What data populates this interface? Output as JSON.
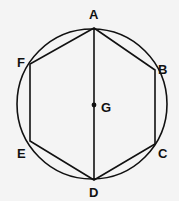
{
  "diagram": {
    "type": "geometry",
    "colors": {
      "stroke": "#111111",
      "background": "#f4f4f4"
    },
    "circle": {
      "cx": 92,
      "cy": 104,
      "r": 75
    },
    "points": {
      "A": {
        "label": "A",
        "x": 94,
        "y": 28
      },
      "B": {
        "label": "B",
        "x": 155,
        "y": 70
      },
      "C": {
        "label": "C",
        "x": 155,
        "y": 144
      },
      "D": {
        "label": "D",
        "x": 94,
        "y": 180
      },
      "E": {
        "label": "E",
        "x": 30,
        "y": 141
      },
      "F": {
        "label": "F",
        "x": 30,
        "y": 64
      },
      "G": {
        "label": "G",
        "x": 94,
        "y": 105
      }
    },
    "segments": [
      "AB",
      "BC",
      "CD",
      "DE",
      "EF",
      "FA",
      "AD"
    ]
  }
}
